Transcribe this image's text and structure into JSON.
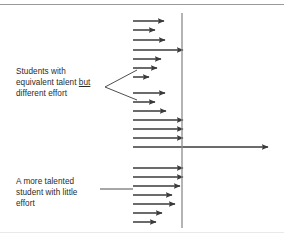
{
  "figure": {
    "title": "Students with equivalent talent but different effort",
    "background_color": "#ffffff",
    "stroke_color": "#3a3a3a",
    "axis_color": "#8c8c8c",
    "rule_color": "#9a9a9a",
    "text_color": "#2b2b2b"
  },
  "labels": {
    "effort_variation": {
      "line1": "Students with",
      "line2_pre": "equivalent talent ",
      "line2_emphasis": "but",
      "line3": "different effort"
    },
    "talented_little_effort": {
      "line1": "A more talented",
      "line2": "student with little",
      "line3": "effort"
    }
  },
  "chart_data": {
    "type": "bar",
    "title": "Students with equivalent talent but different effort",
    "xlabel": "",
    "ylabel": "",
    "orientation": "horizontal",
    "grid": false,
    "legend": null,
    "threshold_line_x": 182,
    "arrow_tail_x": 133,
    "groups": [
      {
        "name": "equivalent-talent-different-effort-upper",
        "annotation": "Students with equivalent talent but different effort",
        "arrows": [
          {
            "y": 21,
            "tip_x": 164
          },
          {
            "y": 30,
            "tip_x": 155
          },
          {
            "y": 40,
            "tip_x": 165
          },
          {
            "y": 50,
            "tip_x": 183
          },
          {
            "y": 59,
            "tip_x": 161
          },
          {
            "y": 68,
            "tip_x": 157
          },
          {
            "y": 77,
            "tip_x": 149
          }
        ]
      },
      {
        "name": "equivalent-talent-different-effort-lower",
        "annotation": "Students with equivalent talent but different effort",
        "arrows": [
          {
            "y": 93,
            "tip_x": 165
          },
          {
            "y": 102,
            "tip_x": 155
          },
          {
            "y": 111,
            "tip_x": 166
          },
          {
            "y": 120,
            "tip_x": 183
          },
          {
            "y": 129,
            "tip_x": 183
          },
          {
            "y": 138,
            "tip_x": 183
          }
        ]
      },
      {
        "name": "reference-long-arrow",
        "annotation": "",
        "arrows": [
          {
            "y": 147,
            "tip_x": 268
          }
        ]
      },
      {
        "name": "more-talented-little-effort",
        "annotation": "A more talented student with little effort",
        "arrows": [
          {
            "y": 168,
            "tip_x": 183
          },
          {
            "y": 177,
            "tip_x": 183
          },
          {
            "y": 186,
            "tip_x": 180
          },
          {
            "y": 195,
            "tip_x": 172
          },
          {
            "y": 204,
            "tip_x": 175
          },
          {
            "y": 213,
            "tip_x": 162
          },
          {
            "y": 222,
            "tip_x": 156
          }
        ]
      }
    ],
    "leaders": [
      {
        "name": "bracket-to-effort-groups",
        "kind": "v-bracket",
        "apex": [
          105,
          87
        ],
        "upper_end": [
          137,
          70
        ],
        "lower_end": [
          137,
          100
        ]
      },
      {
        "name": "line-to-talented-group",
        "kind": "straight",
        "from": [
          100,
          189
        ],
        "to": [
          133,
          189
        ]
      }
    ]
  }
}
